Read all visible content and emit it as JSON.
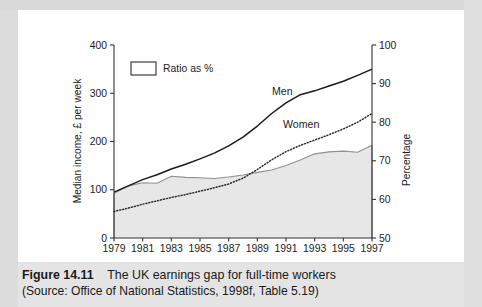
{
  "caption": {
    "figure_number": "Figure 14.11",
    "title": "The UK earnings gap for full-time workers",
    "source": "(Source: Office of National Statistics, 1998f, Table 5.19)"
  },
  "chart_data": {
    "type": "line",
    "title": "The UK earnings gap for full-time workers",
    "xlabel": "",
    "ylabel": "Median income, £ per week",
    "y2label": "Percentage",
    "xlim": [
      1979,
      1997
    ],
    "ylim": [
      0,
      400
    ],
    "y2lim": [
      50,
      100
    ],
    "grid": false,
    "legend": {
      "position": "top-left-inside",
      "entries": [
        {
          "label": "Ratio as %",
          "style": "filled-area",
          "swatch": "#ffffff"
        }
      ]
    },
    "annotations": [
      {
        "text": "Men",
        "x": 1990,
        "y": 275,
        "series": "Men"
      },
      {
        "text": "Women",
        "x": 1991.4,
        "y": 212,
        "series": "Women"
      }
    ],
    "x": [
      1979,
      1980,
      1981,
      1982,
      1983,
      1984,
      1985,
      1986,
      1987,
      1988,
      1989,
      1990,
      1991,
      1992,
      1993,
      1994,
      1995,
      1996,
      1997
    ],
    "xticks": [
      1979,
      1981,
      1983,
      1985,
      1987,
      1989,
      1991,
      1993,
      1995,
      1997
    ],
    "yticks": [
      0,
      100,
      200,
      300,
      400
    ],
    "y2ticks": [
      50,
      60,
      70,
      80,
      90,
      100
    ],
    "series": [
      {
        "name": "Men",
        "axis": "left",
        "style": "solid",
        "color": "#1a1a1a",
        "values": [
          95,
          108,
          121,
          131,
          143,
          153,
          164,
          176,
          191,
          209,
          232,
          258,
          280,
          297,
          305,
          315,
          325,
          337,
          350
        ]
      },
      {
        "name": "Women",
        "axis": "left",
        "style": "dotted",
        "color": "#2a2a2a",
        "values": [
          55,
          62,
          70,
          77,
          84,
          90,
          97,
          104,
          112,
          124,
          142,
          162,
          179,
          192,
          203,
          214,
          226,
          240,
          258
        ]
      },
      {
        "name": "Ratio as %",
        "axis": "right",
        "style": "area",
        "color": "#8c8c8c",
        "fill": "#e8e8e8",
        "values": [
          61.5,
          63.5,
          64.3,
          64.2,
          66.0,
          65.7,
          65.6,
          65.4,
          65.8,
          66.3,
          67.0,
          67.6,
          68.8,
          70.2,
          71.8,
          72.3,
          72.5,
          72.2,
          74.0
        ]
      }
    ]
  },
  "axes": {
    "left_title": "Median income, £ per week",
    "right_title": "Percentage",
    "left_ticks": [
      "0",
      "100",
      "200",
      "300",
      "400"
    ],
    "right_ticks": [
      "50",
      "60",
      "70",
      "80",
      "90",
      "100"
    ],
    "x_ticks": [
      "1979",
      "1981",
      "1983",
      "1985",
      "1987",
      "1989",
      "1991",
      "1993",
      "1995",
      "1997"
    ]
  },
  "labels": {
    "men": "Men",
    "women": "Women",
    "legend_ratio": "Ratio as %"
  }
}
